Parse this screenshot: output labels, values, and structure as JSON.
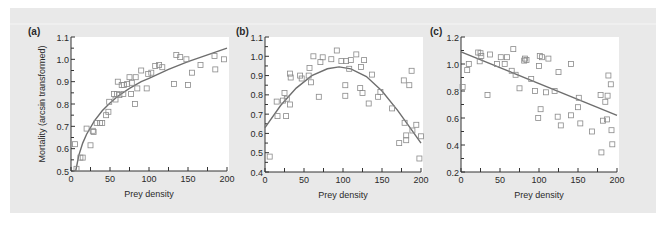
{
  "figure": {
    "background": "#e9e9e9",
    "plot_background": "#ffffff",
    "marker_color": "#8a8a8a",
    "curve_color": "#6e6e6e",
    "axis_color": "#333333"
  },
  "chart_data": [
    {
      "panel_label": "(a)",
      "type": "scatter",
      "fit": "logarithmic",
      "xlabel": "Prey density",
      "ylabel": "Mortality (arcsin transformed)",
      "xlim": [
        0,
        200
      ],
      "ylim": [
        0.5,
        1.1
      ],
      "xticks": [
        0,
        50,
        100,
        150,
        200
      ],
      "yticks": [
        0.5,
        0.6,
        0.7,
        0.8,
        0.9,
        1.0,
        1.1
      ],
      "ytick_labels": [
        "0.5",
        "0.6",
        "0.7",
        "0.8",
        "0.9",
        "1.0",
        "1.1"
      ],
      "grid": false,
      "points": [
        [
          5,
          0.62
        ],
        [
          7,
          0.51
        ],
        [
          12,
          0.56
        ],
        [
          15,
          0.56
        ],
        [
          20,
          0.69
        ],
        [
          25,
          0.615
        ],
        [
          28,
          0.68
        ],
        [
          29,
          0.675
        ],
        [
          33,
          0.715
        ],
        [
          37,
          0.715
        ],
        [
          40,
          0.715
        ],
        [
          45,
          0.75
        ],
        [
          48,
          0.765
        ],
        [
          49,
          0.81
        ],
        [
          55,
          0.845
        ],
        [
          57,
          0.82
        ],
        [
          59,
          0.845
        ],
        [
          60,
          0.9
        ],
        [
          62,
          0.84
        ],
        [
          65,
          0.885
        ],
        [
          67,
          0.845
        ],
        [
          68,
          0.885
        ],
        [
          72,
          0.89
        ],
        [
          75,
          0.92
        ],
        [
          77,
          0.845
        ],
        [
          78,
          0.895
        ],
        [
          82,
          0.8
        ],
        [
          83,
          0.92
        ],
        [
          85,
          0.87
        ],
        [
          90,
          0.95
        ],
        [
          97,
          0.87
        ],
        [
          99,
          0.935
        ],
        [
          103,
          0.94
        ],
        [
          108,
          0.97
        ],
        [
          113,
          0.975
        ],
        [
          117,
          0.965
        ],
        [
          132,
          0.89
        ],
        [
          135,
          1.02
        ],
        [
          140,
          1.01
        ],
        [
          148,
          1.0
        ],
        [
          150,
          0.885
        ],
        [
          155,
          0.94
        ],
        [
          166,
          0.975
        ],
        [
          184,
          1.015
        ],
        [
          185,
          0.955
        ],
        [
          196,
          1.0
        ]
      ],
      "curve": [
        [
          6,
          0.5
        ],
        [
          10,
          0.57
        ],
        [
          15,
          0.625
        ],
        [
          20,
          0.665
        ],
        [
          30,
          0.725
        ],
        [
          40,
          0.77
        ],
        [
          50,
          0.805
        ],
        [
          60,
          0.835
        ],
        [
          75,
          0.87
        ],
        [
          90,
          0.9
        ],
        [
          100,
          0.915
        ],
        [
          125,
          0.955
        ],
        [
          150,
          0.99
        ],
        [
          175,
          1.02
        ],
        [
          200,
          1.05
        ]
      ]
    },
    {
      "panel_label": "(b)",
      "type": "scatter",
      "fit": "quadratic",
      "xlabel": "Prey density",
      "ylabel": "",
      "xlim": [
        0,
        200
      ],
      "ylim": [
        0.4,
        1.1
      ],
      "xticks": [
        0,
        50,
        100,
        150,
        200
      ],
      "yticks": [
        0.4,
        0.5,
        0.6,
        0.7,
        0.8,
        0.9,
        1.0,
        1.1
      ],
      "ytick_labels": [
        "0.4",
        "0.5",
        "0.6",
        "0.7",
        "0.8",
        "0.9",
        "1.0",
        "1.1"
      ],
      "grid": false,
      "points": [
        [
          6,
          0.48
        ],
        [
          15,
          0.765
        ],
        [
          16,
          0.69
        ],
        [
          23,
          0.77
        ],
        [
          25,
          0.81
        ],
        [
          27,
          0.69
        ],
        [
          28,
          0.78
        ],
        [
          32,
          0.75
        ],
        [
          32,
          0.91
        ],
        [
          33,
          0.89
        ],
        [
          45,
          0.9
        ],
        [
          47,
          0.885
        ],
        [
          56,
          0.9
        ],
        [
          57,
          0.94
        ],
        [
          59,
          0.865
        ],
        [
          62,
          1.0
        ],
        [
          69,
          0.79
        ],
        [
          71,
          0.97
        ],
        [
          74,
          0.995
        ],
        [
          85,
          0.985
        ],
        [
          92,
          1.03
        ],
        [
          98,
          0.975
        ],
        [
          103,
          0.85
        ],
        [
          103,
          0.795
        ],
        [
          104,
          0.975
        ],
        [
          108,
          0.935
        ],
        [
          110,
          0.98
        ],
        [
          117,
          1.01
        ],
        [
          122,
          0.835
        ],
        [
          123,
          0.945
        ],
        [
          125,
          0.81
        ],
        [
          127,
          0.98
        ],
        [
          133,
          0.755
        ],
        [
          137,
          0.905
        ],
        [
          145,
          0.79
        ],
        [
          148,
          0.815
        ],
        [
          163,
          0.73
        ],
        [
          172,
          0.55
        ],
        [
          178,
          0.875
        ],
        [
          179,
          0.655
        ],
        [
          181,
          0.59
        ],
        [
          181,
          0.565
        ],
        [
          185,
          0.85
        ],
        [
          188,
          0.925
        ],
        [
          189,
          0.615
        ],
        [
          194,
          0.645
        ],
        [
          198,
          0.47
        ],
        [
          200,
          0.585
        ]
      ],
      "curve": [
        [
          0,
          0.63
        ],
        [
          20,
          0.745
        ],
        [
          40,
          0.835
        ],
        [
          60,
          0.9
        ],
        [
          80,
          0.935
        ],
        [
          95,
          0.945
        ],
        [
          110,
          0.935
        ],
        [
          130,
          0.895
        ],
        [
          150,
          0.82
        ],
        [
          170,
          0.72
        ],
        [
          185,
          0.635
        ],
        [
          200,
          0.55
        ]
      ]
    },
    {
      "panel_label": "(c)",
      "type": "scatter",
      "fit": "linear",
      "xlabel": "Prey density",
      "ylabel": "",
      "xlim": [
        0,
        200
      ],
      "ylim": [
        0.2,
        1.2
      ],
      "xticks": [
        0,
        50,
        100,
        150,
        200
      ],
      "yticks": [
        0.2,
        0.4,
        0.6,
        0.8,
        1.0,
        1.2
      ],
      "ytick_labels": [
        "0.2",
        "0.4",
        "0.6",
        "0.8",
        "1.0",
        "1.2"
      ],
      "grid": false,
      "points": [
        [
          2,
          0.83
        ],
        [
          8,
          0.955
        ],
        [
          10,
          1.0
        ],
        [
          22,
          1.085
        ],
        [
          24,
          1.02
        ],
        [
          25,
          1.08
        ],
        [
          26,
          1.06
        ],
        [
          34,
          0.77
        ],
        [
          37,
          1.07
        ],
        [
          46,
          1.0
        ],
        [
          51,
          1.05
        ],
        [
          56,
          1.0
        ],
        [
          59,
          1.05
        ],
        [
          65,
          0.95
        ],
        [
          67,
          1.11
        ],
        [
          70,
          0.92
        ],
        [
          75,
          0.82
        ],
        [
          81,
          1.025
        ],
        [
          82,
          1.04
        ],
        [
          84,
          1.03
        ],
        [
          90,
          0.89
        ],
        [
          95,
          0.8
        ],
        [
          99,
          0.6
        ],
        [
          100,
          0.985
        ],
        [
          101,
          1.06
        ],
        [
          102,
          0.665
        ],
        [
          104,
          1.05
        ],
        [
          109,
          0.79
        ],
        [
          112,
          1.04
        ],
        [
          120,
          0.8
        ],
        [
          124,
          0.61
        ],
        [
          125,
          0.94
        ],
        [
          128,
          0.545
        ],
        [
          141,
          0.62
        ],
        [
          141,
          1.0
        ],
        [
          150,
          0.68
        ],
        [
          151,
          0.75
        ],
        [
          153,
          0.56
        ],
        [
          168,
          0.5
        ],
        [
          179,
          0.77
        ],
        [
          180,
          0.345
        ],
        [
          182,
          0.58
        ],
        [
          185,
          0.72
        ],
        [
          187,
          0.59
        ],
        [
          188,
          0.765
        ],
        [
          189,
          0.915
        ],
        [
          192,
          0.85
        ],
        [
          193,
          0.51
        ],
        [
          194,
          0.405
        ]
      ],
      "curve": [
        [
          0,
          1.09
        ],
        [
          200,
          0.62
        ]
      ]
    }
  ]
}
